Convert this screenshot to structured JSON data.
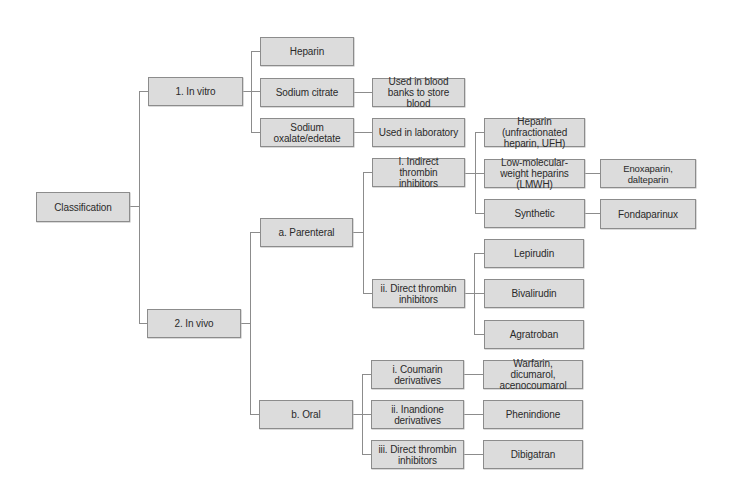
{
  "diagram": {
    "colors": {
      "node_fill": "#dcdcdc",
      "node_border": "#8c8c8c",
      "connector": "#8c8c8c",
      "text": "#2a2a2a",
      "background": "#ffffff"
    },
    "root": "Classification",
    "level1": {
      "in_vitro": "1. In vitro",
      "in_vivo": "2. In vivo"
    },
    "in_vitro": {
      "heparin": "Heparin",
      "sodium_citrate": "Sodium citrate",
      "sodium_oxalate": "Sodium oxalate/edetate",
      "sodium_citrate_use": "Used in blood banks to store blood",
      "sodium_oxalate_use": "Used in laboratory"
    },
    "in_vivo": {
      "parenteral": "a. Parenteral",
      "oral": "b. Oral"
    },
    "parenteral": {
      "indirect": "I. Indirect thrombin inhibitors",
      "direct": "ii. Direct thrombin inhibitors"
    },
    "indirect": {
      "ufh": "Heparin (unfractionated heparin, UFH)",
      "lmwh": "Low-molecular-weight heparins (LMWH)",
      "synthetic": "Synthetic",
      "lmwh_examples": "Enoxaparin, dalteparin",
      "synthetic_examples": "Fondaparinux"
    },
    "direct": {
      "lepirudin": "Lepirudin",
      "bivalirudin": "Bivalirudin",
      "agratroban": "Agratroban"
    },
    "oral": {
      "coumarin": "i. Coumarin derivatives",
      "inandione": "ii. Inandione derivatives",
      "direct": "iii. Direct thrombin inhibitors",
      "coumarin_examples": "Warfarin, dicumarol, acenocoumarol",
      "inandione_examples": "Phenindione",
      "direct_examples": "Dibigatran"
    }
  }
}
